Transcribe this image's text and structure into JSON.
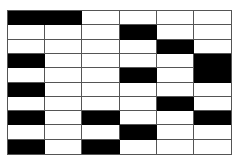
{
  "diagram": {
    "type": "grid-pattern",
    "rows": 10,
    "columns": 6,
    "colors": {
      "filled": "#000000",
      "empty": "#ffffff",
      "line": "#555555"
    },
    "filled_blocks": [
      {
        "row": 1,
        "col": 1,
        "colspan": 2,
        "rowspan": 1
      },
      {
        "row": 2,
        "col": 4,
        "colspan": 1,
        "rowspan": 1
      },
      {
        "row": 3,
        "col": 5,
        "colspan": 1,
        "rowspan": 1
      },
      {
        "row": 4,
        "col": 1,
        "colspan": 1,
        "rowspan": 1
      },
      {
        "row": 4,
        "col": 6,
        "colspan": 1,
        "rowspan": 2
      },
      {
        "row": 5,
        "col": 4,
        "colspan": 1,
        "rowspan": 1
      },
      {
        "row": 6,
        "col": 1,
        "colspan": 1,
        "rowspan": 1
      },
      {
        "row": 7,
        "col": 5,
        "colspan": 1,
        "rowspan": 1
      },
      {
        "row": 8,
        "col": 1,
        "colspan": 1,
        "rowspan": 1
      },
      {
        "row": 8,
        "col": 3,
        "colspan": 1,
        "rowspan": 1
      },
      {
        "row": 8,
        "col": 6,
        "colspan": 1,
        "rowspan": 1
      },
      {
        "row": 9,
        "col": 4,
        "colspan": 1,
        "rowspan": 1
      },
      {
        "row": 10,
        "col": 1,
        "colspan": 1,
        "rowspan": 1
      },
      {
        "row": 10,
        "col": 3,
        "colspan": 1,
        "rowspan": 1
      }
    ]
  }
}
